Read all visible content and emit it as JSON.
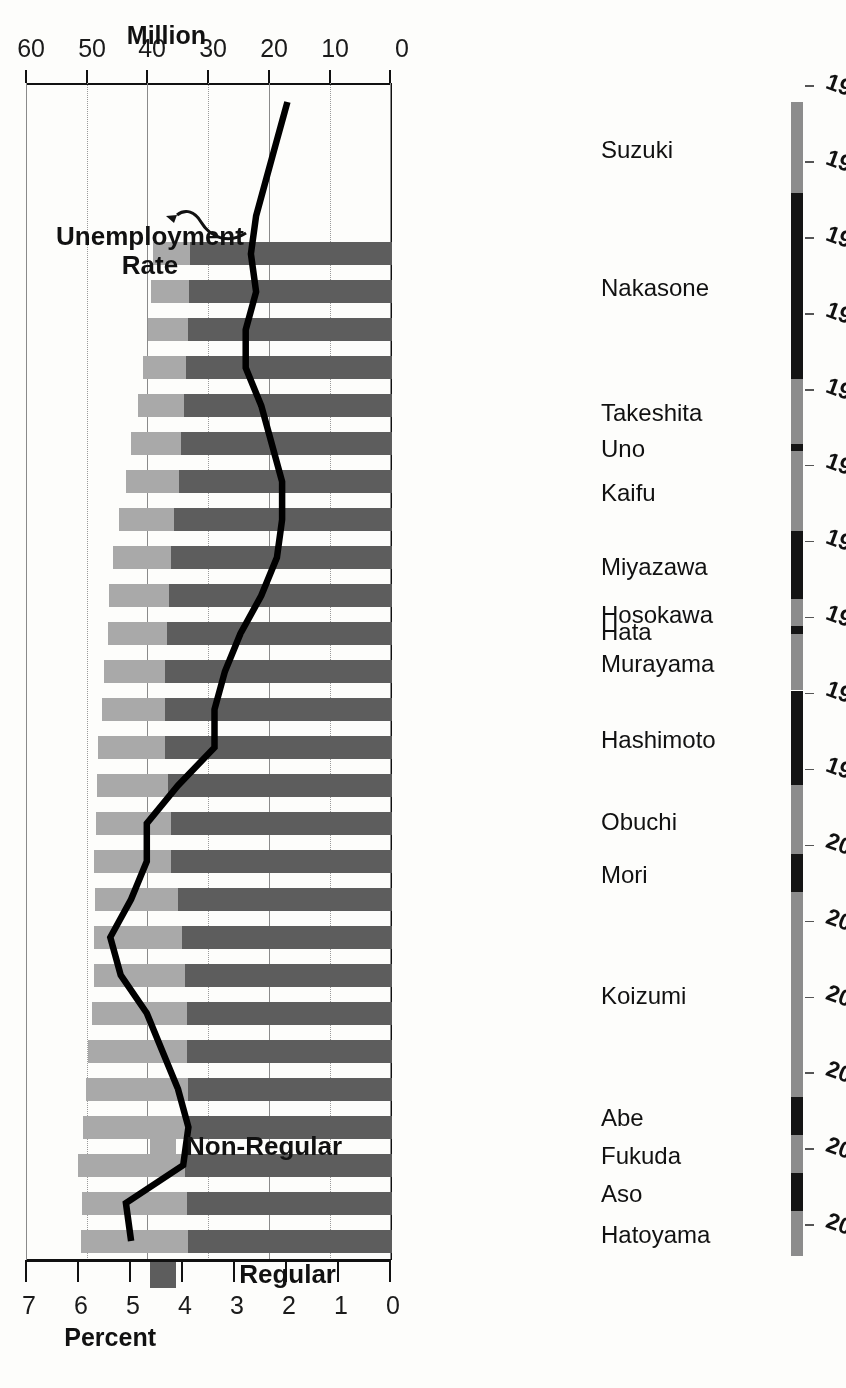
{
  "chart_data": {
    "type": "bar",
    "title": "",
    "subtitle": "",
    "orientation": "horizontal-scan-rotated-180",
    "xlabel": "",
    "ylabel": "Million",
    "y2label": "Percent",
    "ylim": [
      0,
      60
    ],
    "y2lim": [
      0,
      7
    ],
    "grid": true,
    "legend_position": "bottom-left",
    "million_ticks": [
      "0",
      "10",
      "20",
      "30",
      "40",
      "50",
      "60"
    ],
    "percent_ticks": [
      "0",
      "1",
      "2",
      "3",
      "4",
      "5",
      "6",
      "7"
    ],
    "million_axis_title": "Million",
    "percent_axis_title": "Percent",
    "categories": [
      1984,
      1985,
      1986,
      1987,
      1988,
      1989,
      1990,
      1991,
      1992,
      1993,
      1994,
      1995,
      1996,
      1997,
      1998,
      1999,
      2000,
      2001,
      2002,
      2003,
      2004,
      2005,
      2006,
      2007,
      2008,
      2009,
      2010
    ],
    "series": [
      {
        "name": "Regular",
        "unit": "Million",
        "color": "#5d5d5d",
        "values": [
          33.3,
          33.4,
          33.6,
          33.9,
          34.3,
          34.7,
          35.0,
          35.9,
          36.3,
          36.7,
          37.1,
          37.4,
          37.3,
          37.4,
          36.9,
          36.4,
          36.3,
          35.3,
          34.6,
          34.1,
          33.8,
          33.7,
          33.6,
          33.6,
          34.1,
          33.8,
          33.6
        ]
      },
      {
        "name": "Non-Regular",
        "unit": "Million",
        "color": "#a9a9a9",
        "values": [
          6.0,
          6.2,
          6.6,
          7.1,
          7.5,
          8.2,
          8.8,
          9.0,
          9.6,
          9.9,
          9.7,
          10.0,
          10.4,
          11.0,
          11.7,
          12.3,
          12.7,
          13.6,
          14.5,
          15.0,
          15.6,
          16.3,
          16.8,
          17.3,
          17.6,
          17.2,
          17.6
        ]
      }
    ],
    "line_series": {
      "name": "Unemployment Rate",
      "unit": "Percent",
      "color": "#000000",
      "x": [
        1980,
        1981,
        1982,
        1983,
        1984,
        1985,
        1986,
        1987,
        1988,
        1989,
        1990,
        1991,
        1992,
        1993,
        1994,
        1995,
        1996,
        1997,
        1998,
        1999,
        2000,
        2001,
        2002,
        2003,
        2004,
        2005,
        2006,
        2007,
        2008,
        2009,
        2010
      ],
      "values": [
        2.0,
        2.2,
        2.4,
        2.6,
        2.7,
        2.6,
        2.8,
        2.8,
        2.5,
        2.3,
        2.1,
        2.1,
        2.2,
        2.5,
        2.9,
        3.2,
        3.4,
        3.4,
        4.1,
        4.7,
        4.7,
        5.0,
        5.4,
        5.2,
        4.7,
        4.4,
        4.1,
        3.9,
        4.0,
        5.1,
        5.0
      ]
    },
    "annotation": {
      "text_line1": "Unemployment",
      "text_line2": "Rate"
    },
    "legend": [
      {
        "label": "Regular",
        "color": "#5d5d5d"
      },
      {
        "label": "Non-Regular",
        "color": "#a9a9a9"
      }
    ],
    "prime_ministers": [
      {
        "name": "Suzuki",
        "start": 1980.5,
        "end": 1982.9,
        "shade": "a"
      },
      {
        "name": "Nakasone",
        "start": 1982.9,
        "end": 1987.8,
        "shade": "b"
      },
      {
        "name": "Takeshita",
        "start": 1987.8,
        "end": 1989.5,
        "shade": "a"
      },
      {
        "name": "Uno",
        "start": 1989.5,
        "end": 1989.7,
        "shade": "b"
      },
      {
        "name": "Kaifu",
        "start": 1989.7,
        "end": 1991.8,
        "shade": "a"
      },
      {
        "name": "Miyazawa",
        "start": 1991.8,
        "end": 1993.6,
        "shade": "b"
      },
      {
        "name": "Hosokawa",
        "start": 1993.6,
        "end": 1994.3,
        "shade": "a"
      },
      {
        "name": "Hata",
        "start": 1994.3,
        "end": 1994.5,
        "shade": "b"
      },
      {
        "name": "Murayama",
        "start": 1994.5,
        "end": 1996.0,
        "shade": "a"
      },
      {
        "name": "Hashimoto",
        "start": 1996.0,
        "end": 1998.5,
        "shade": "b"
      },
      {
        "name": "Obuchi",
        "start": 1998.5,
        "end": 2000.3,
        "shade": "a"
      },
      {
        "name": "Mori",
        "start": 2000.3,
        "end": 2001.3,
        "shade": "b"
      },
      {
        "name": "Koizumi",
        "start": 2001.3,
        "end": 2006.7,
        "shade": "a"
      },
      {
        "name": "Abe",
        "start": 2006.7,
        "end": 2007.7,
        "shade": "b"
      },
      {
        "name": "Fukuda",
        "start": 2007.7,
        "end": 2008.7,
        "shade": "a"
      },
      {
        "name": "Aso",
        "start": 2008.7,
        "end": 2009.7,
        "shade": "b"
      },
      {
        "name": "Hatoyama",
        "start": 2009.7,
        "end": 2010.9,
        "shade": "a"
      }
    ],
    "year_axis_labels": [
      "1980",
      "1982",
      "1984",
      "1986",
      "1988",
      "1990",
      "1992",
      "1994",
      "1996",
      "1998",
      "2000",
      "2002",
      "2004",
      "2006",
      "2008",
      "2010"
    ]
  }
}
